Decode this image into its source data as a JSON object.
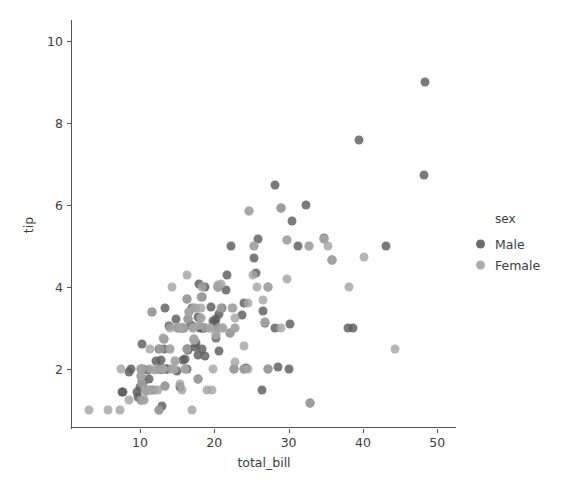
{
  "figure": {
    "background": "#ffffff",
    "width": 581,
    "height": 492
  },
  "axes": {
    "xlabel": "total_bill",
    "ylabel": "tip",
    "x_ticklabels": [
      "10",
      "20",
      "30",
      "40",
      "50"
    ],
    "y_ticklabels": [
      "2",
      "4",
      "6",
      "8",
      "10"
    ],
    "spine_color": "#555555",
    "tick_color": "#3d3d3d"
  },
  "legend": {
    "title": "sex",
    "entries": [
      {
        "label": "Male",
        "color": "#5d5d5d"
      },
      {
        "label": "Female",
        "color": "#a5a5a5"
      }
    ]
  },
  "chart_data": {
    "type": "scatter",
    "title": "",
    "xlabel": "total_bill",
    "ylabel": "tip",
    "xlim": [
      2.0,
      53.0
    ],
    "ylim": [
      0.7,
      10.4
    ],
    "xticks": [
      10,
      20,
      30,
      40,
      50
    ],
    "yticks": [
      2,
      4,
      6,
      8,
      10
    ],
    "grid": false,
    "legend_position": "right",
    "legend_title": "sex",
    "marker_size_px": 9,
    "marker_opacity": 0.82,
    "series": [
      {
        "name": "Male",
        "color": "#5d5d5d",
        "x": [
          10.34,
          21.01,
          23.68,
          25.29,
          8.77,
          26.88,
          15.04,
          14.78,
          10.27,
          15.42,
          18.43,
          21.58,
          16.29,
          16.97,
          20.65,
          17.92,
          20.29,
          15.77,
          39.42,
          19.82,
          17.81,
          13.37,
          12.69,
          21.7,
          9.55,
          18.35,
          15.06,
          20.69,
          17.78,
          24.06,
          16.31,
          16.93,
          18.69,
          31.27,
          16.04,
          17.46,
          13.94,
          9.68,
          30.4,
          18.29,
          22.23,
          32.4,
          28.55,
          18.04,
          12.54,
          10.29,
          34.81,
          9.94,
          25.56,
          19.49,
          38.01,
          26.41,
          11.24,
          48.27,
          20.29,
          13.81,
          11.02,
          18.29,
          17.59,
          20.08,
          16.45,
          7.56,
          10.34,
          43.11,
          13.0,
          13.51,
          18.71,
          12.74,
          13.0,
          16.4,
          20.53,
          16.47,
          26.59,
          38.73,
          24.27,
          12.76,
          30.06,
          25.89,
          48.33,
          13.27,
          28.17,
          12.9,
          28.15,
          11.59,
          7.74,
          30.14,
          12.16,
          13.42,
          8.58,
          15.98,
          13.42,
          16.27,
          10.09,
          20.45,
          13.28,
          22.12,
          24.01,
          15.69,
          11.61,
          10.77,
          15.53,
          10.07,
          12.6,
          32.83,
          35.83,
          29.03,
          27.18,
          22.67,
          17.82,
          18.78
        ],
        "y": [
          1.66,
          3.5,
          3.31,
          4.71,
          2.0,
          3.12,
          1.96,
          3.23,
          1.71,
          1.57,
          3.0,
          3.92,
          3.71,
          3.5,
          3.35,
          4.08,
          2.75,
          2.23,
          7.58,
          3.18,
          2.34,
          2.0,
          2.0,
          4.3,
          1.45,
          2.5,
          3.0,
          2.45,
          3.27,
          3.6,
          2.0,
          3.07,
          2.31,
          5.0,
          2.24,
          2.54,
          3.06,
          1.32,
          5.6,
          3.0,
          5.0,
          6.0,
          2.05,
          3.0,
          2.5,
          2.6,
          5.2,
          1.56,
          4.34,
          3.51,
          3.0,
          1.5,
          1.76,
          6.73,
          3.21,
          2.0,
          1.98,
          3.76,
          2.64,
          3.15,
          2.47,
          1.44,
          2.0,
          5.0,
          2.0,
          2.0,
          4.0,
          2.01,
          2.0,
          2.5,
          4.0,
          3.23,
          3.41,
          3.0,
          2.03,
          2.23,
          2.0,
          5.16,
          9.0,
          2.5,
          6.5,
          1.1,
          3.0,
          1.5,
          1.44,
          3.09,
          2.2,
          3.48,
          1.92,
          3.0,
          1.58,
          2.5,
          2.0,
          3.0,
          2.72,
          2.88,
          2.0,
          3.0,
          3.39,
          1.47,
          3.0,
          1.25,
          1.0,
          1.17,
          4.67,
          5.92,
          2.0,
          2.0,
          1.75,
          3.0
        ]
      },
      {
        "name": "Female",
        "color": "#a5a5a5",
        "x": [
          16.99,
          24.59,
          35.26,
          14.83,
          10.33,
          16.29,
          10.65,
          17.26,
          24.71,
          10.07,
          34.83,
          17.07,
          26.86,
          25.28,
          14.73,
          10.51,
          17.92,
          27.2,
          22.76,
          17.29,
          19.44,
          16.66,
          10.07,
          32.68,
          15.98,
          34.83,
          13.03,
          18.28,
          24.71,
          21.16,
          28.97,
          22.49,
          5.75,
          16.32,
          22.75,
          40.17,
          27.28,
          12.03,
          21.01,
          12.46,
          11.35,
          15.38,
          44.3,
          22.42,
          20.92,
          15.36,
          20.49,
          25.21,
          18.24,
          14.31,
          14.0,
          7.25,
          38.07,
          23.95,
          35.83,
          29.85,
          25.71,
          17.31,
          29.8,
          26.55,
          14.07,
          13.13,
          17.26,
          24.55,
          19.77,
          29.85,
          13.42,
          16.27,
          10.09,
          20.45,
          13.28,
          22.12,
          24.01,
          15.69,
          11.61,
          10.77,
          15.53,
          10.07,
          12.6,
          32.83,
          35.83,
          29.03,
          27.18,
          22.67,
          17.82,
          18.78,
          16.0,
          20.9,
          18.15,
          15.69,
          19.65,
          14.52,
          22.82,
          19.08,
          20.27,
          11.17,
          12.26,
          18.26,
          8.51,
          10.33,
          14.15,
          16.0,
          13.16,
          17.47,
          14.07,
          20.53,
          16.47,
          12.66,
          18.26,
          20.53,
          16.66,
          7.51,
          14.52,
          11.38,
          20.27,
          11.17,
          3.07,
          12.02,
          17.07,
          26.86,
          25.28,
          14.73,
          10.51,
          17.92,
          27.2,
          22.76,
          17.29,
          19.44,
          16.66,
          10.07,
          32.68
        ],
        "y": [
          1.01,
          3.61,
          5.0,
          3.02,
          1.67,
          3.71,
          1.5,
          2.74,
          5.85,
          1.83,
          5.17,
          3.0,
          3.14,
          5.0,
          2.2,
          1.25,
          3.08,
          4.0,
          3.0,
          2.71,
          3.0,
          3.4,
          1.83,
          5.0,
          3.0,
          5.17,
          2.0,
          4.0,
          5.85,
          3.0,
          3.0,
          3.5,
          1.0,
          4.3,
          3.25,
          4.73,
          4.0,
          1.5,
          3.0,
          1.5,
          2.5,
          3.0,
          2.5,
          3.48,
          4.08,
          1.64,
          4.06,
          4.29,
          3.76,
          4.0,
          3.0,
          1.0,
          4.0,
          2.55,
          4.67,
          5.14,
          4.0,
          3.5,
          4.2,
          3.68,
          2.5,
          2.0,
          2.74,
          2.0,
          2.0,
          5.14,
          1.58,
          2.5,
          2.0,
          3.0,
          2.72,
          2.88,
          2.0,
          3.0,
          3.39,
          1.47,
          3.0,
          1.25,
          1.0,
          1.17,
          4.67,
          5.92,
          2.0,
          2.0,
          1.75,
          3.0,
          2.0,
          3.5,
          3.5,
          1.5,
          1.5,
          2.0,
          2.18,
          1.5,
          2.83,
          1.5,
          2.0,
          3.25,
          1.25,
          2.0,
          2.0,
          2.0,
          2.75,
          3.5,
          2.5,
          4.0,
          3.23,
          2.5,
          3.25,
          4.0,
          3.4,
          2.0,
          2.0,
          2.0,
          2.83,
          1.5,
          1.0,
          1.97,
          3.0,
          3.14,
          5.0,
          2.2,
          1.25,
          3.08,
          4.0,
          3.0,
          2.71,
          3.0,
          3.4,
          1.83,
          5.0
        ]
      }
    ]
  },
  "axis_mapping": {
    "x_px_at_10": 140,
    "x_px_per_unit": 7.43,
    "y_px_at_10": 41,
    "y_px_per_unit": 41.0
  }
}
